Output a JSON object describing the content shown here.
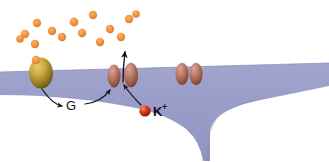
{
  "diagram": {
    "background_color": "#ffffff",
    "membrane": {
      "name": "cell-membrane",
      "fill_color": "#9a9ec8",
      "edge_color": "#8f93bd",
      "top_edge_y": 72,
      "description": "lavender cell body with forked notch on right"
    },
    "labels": {
      "g_protein": "G",
      "potassium_ion": "K",
      "potassium_charge": "+"
    },
    "receptor": {
      "name": "membrane-receptor",
      "color_light": "#d8b84e",
      "color_dark": "#6e5a16",
      "cx": 41,
      "cy": 73,
      "rx": 12,
      "ry": 15
    },
    "ligand_bound": {
      "name": "bound-ligand",
      "color": "#f0943c",
      "cx": 36,
      "cy": 60,
      "r": 4
    },
    "neurotransmitter_dots": {
      "name": "neurotransmitter-molecules",
      "color": "#f0943c",
      "edge_color": "#d9762a",
      "radius": 4,
      "count": 14,
      "positions": [
        [
          37,
          23
        ],
        [
          25,
          34
        ],
        [
          52,
          31
        ],
        [
          35,
          44
        ],
        [
          62,
          37
        ],
        [
          74,
          22
        ],
        [
          82,
          33
        ],
        [
          93,
          15
        ],
        [
          100,
          42
        ],
        [
          110,
          29
        ],
        [
          121,
          37
        ],
        [
          129,
          19
        ],
        [
          136,
          14
        ],
        [
          20,
          39
        ]
      ]
    },
    "channels": [
      {
        "name": "open-potassium-channel",
        "color_light": "#c9897a",
        "color_dark": "#8c4b3c",
        "subunits": [
          {
            "cx": 114,
            "cy": 76,
            "rx": 6.5,
            "ry": 11
          },
          {
            "cx": 131,
            "cy": 74,
            "rx": 7,
            "ry": 12
          }
        ]
      },
      {
        "name": "closed-potassium-channel",
        "color_light": "#c9897a",
        "color_dark": "#8c4b3c",
        "subunits": [
          {
            "cx": 182,
            "cy": 74,
            "rx": 6.5,
            "ry": 11
          },
          {
            "cx": 196,
            "cy": 74,
            "rx": 6.5,
            "ry": 11
          }
        ]
      }
    ],
    "potassium_ion": {
      "name": "potassium-ion",
      "color_light": "#e8603c",
      "color_dark": "#8a1a0c",
      "cx": 145,
      "cy": 111,
      "r": 5.5
    },
    "arrows": {
      "color": "#15151e",
      "receptor_to_g": {
        "name": "arrow-receptor-to-g-protein"
      },
      "g_to_channel": {
        "name": "arrow-g-protein-to-channel"
      },
      "ion_to_channel": {
        "name": "arrow-ion-to-channel"
      },
      "efflux": {
        "name": "arrow-potassium-efflux"
      }
    }
  }
}
